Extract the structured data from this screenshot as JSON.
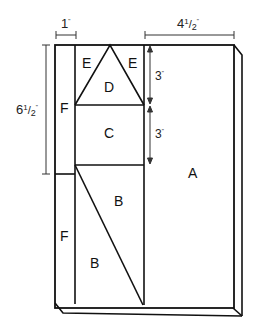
{
  "diagram": {
    "type": "quilt-block-cutting-layout",
    "colors": {
      "line": "#111111",
      "dimension_line": "#333333",
      "background": "#ffffff"
    },
    "dimensions": {
      "top_left": {
        "whole": "1",
        "unit": "\""
      },
      "top_right": {
        "whole": "4",
        "num": "1",
        "den": "2",
        "unit": "\""
      },
      "left_vertical": {
        "whole": "6",
        "num": "1",
        "den": "2",
        "unit": "\""
      },
      "upper_right_inner": {
        "whole": "3",
        "unit": "\""
      },
      "lower_right_inner": {
        "whole": "3",
        "unit": "\""
      }
    },
    "pieces": {
      "A": "A",
      "B_upper": "B",
      "B_lower": "B",
      "C": "C",
      "D": "D",
      "E_left": "E",
      "E_right": "E",
      "F_upper": "F",
      "F_lower": "F"
    }
  }
}
